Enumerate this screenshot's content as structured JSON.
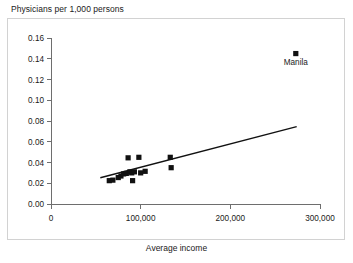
{
  "chart_data": {
    "type": "scatter",
    "title": "Physicians per 1,000 persons",
    "xlabel": "Average income",
    "ylabel": "Physicians per 1,000 persons",
    "xlim": [
      0,
      300000
    ],
    "ylim": [
      0.0,
      0.16
    ],
    "grid": false,
    "legend": null,
    "xticks": [
      0,
      100000,
      200000,
      300000
    ],
    "xtick_labels": [
      "0",
      "100,000",
      "200,000",
      "300,000"
    ],
    "yticks": [
      0.0,
      0.02,
      0.04,
      0.06,
      0.08,
      0.1,
      0.12,
      0.14,
      0.16
    ],
    "ytick_labels": [
      "0.00",
      "0.02",
      "0.04",
      "0.06",
      "0.08",
      "0.10",
      "0.12",
      "0.14",
      "0.16"
    ],
    "points": [
      {
        "x": 65000,
        "y": 0.0225,
        "label": ""
      },
      {
        "x": 69000,
        "y": 0.023,
        "label": ""
      },
      {
        "x": 75000,
        "y": 0.0255,
        "label": ""
      },
      {
        "x": 78000,
        "y": 0.027,
        "label": ""
      },
      {
        "x": 81000,
        "y": 0.029,
        "label": ""
      },
      {
        "x": 84000,
        "y": 0.0295,
        "label": ""
      },
      {
        "x": 86000,
        "y": 0.0445,
        "label": ""
      },
      {
        "x": 88000,
        "y": 0.031,
        "label": ""
      },
      {
        "x": 90000,
        "y": 0.03,
        "label": ""
      },
      {
        "x": 91000,
        "y": 0.0225,
        "label": ""
      },
      {
        "x": 93000,
        "y": 0.031,
        "label": ""
      },
      {
        "x": 98000,
        "y": 0.045,
        "label": ""
      },
      {
        "x": 100000,
        "y": 0.03,
        "label": ""
      },
      {
        "x": 105000,
        "y": 0.0315,
        "label": ""
      },
      {
        "x": 133000,
        "y": 0.045,
        "label": ""
      },
      {
        "x": 134000,
        "y": 0.035,
        "label": ""
      },
      {
        "x": 273000,
        "y": 0.145,
        "label": "Manila"
      }
    ],
    "trendline": {
      "x_start": 55000,
      "y_start": 0.0253,
      "x_end": 274000,
      "y_end": 0.0745
    },
    "annotations": [
      {
        "text": "Manila",
        "x": 273000,
        "y": 0.134
      }
    ]
  }
}
